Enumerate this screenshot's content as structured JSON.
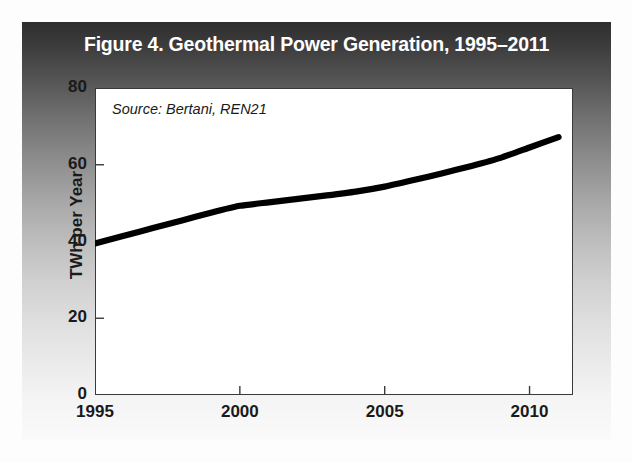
{
  "figure": {
    "title": "Figure 4. Geothermal Power Generation, 1995–2011",
    "source_note": "Source: Bertani, REN21",
    "title_color": "#ffffff",
    "line_color": "#000000",
    "panel_color": "#ffffff"
  },
  "chart_data": {
    "type": "line",
    "title": "Figure 4. Geothermal Power Generation, 1995–2011",
    "subtitle": "",
    "xlabel": "",
    "ylabel": "TWh per Year",
    "annotations": [
      "Source: Bertani, REN21"
    ],
    "grid": false,
    "legend": "none",
    "xlim": [
      1995,
      2011.5
    ],
    "ylim": [
      0,
      80
    ],
    "xticks": [
      1995,
      2000,
      2005,
      2010
    ],
    "xtick_labels": [
      "1995",
      "2000",
      "2005",
      "2010"
    ],
    "yticks": [
      0,
      20,
      40,
      60,
      80
    ],
    "ytick_labels": [
      "0",
      "20",
      "40",
      "60",
      "80"
    ],
    "x": [
      1995,
      1996,
      1997,
      1998,
      1999,
      2000,
      2001,
      2002,
      2003,
      2004,
      2005,
      2006,
      2007,
      2008,
      2009,
      2010,
      2011
    ],
    "series": [
      {
        "name": "Geothermal power generation",
        "values": [
          39.5,
          41.5,
          43.5,
          45.5,
          47.5,
          49.3,
          50.2,
          51.1,
          52.0,
          53.0,
          54.3,
          56.0,
          57.8,
          59.7,
          61.8,
          64.5,
          67.2
        ]
      }
    ]
  }
}
